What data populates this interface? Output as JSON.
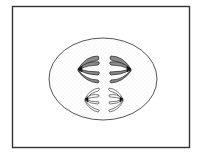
{
  "figure": {
    "colors": {
      "frame": "#333333",
      "cell_outline": "#555555",
      "cytoplasm_stipple": "#9a9a9a",
      "chromosome_fill": "#8a8a8a",
      "chromosome_outline": "#222222",
      "background": "#ffffff"
    },
    "label": ""
  }
}
